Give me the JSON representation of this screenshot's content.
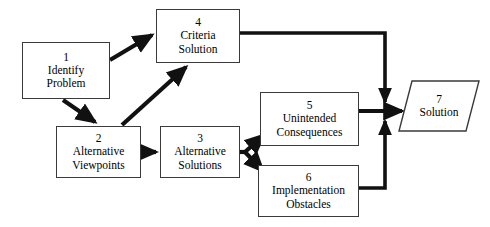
{
  "diagram": {
    "type": "flowchart",
    "background_color": "#ffffff",
    "line_color": "#111111",
    "box_border_color": "#3a3a3a",
    "text_color": "#000000",
    "nodes": [
      {
        "id": "1",
        "number": "1",
        "label_line1": "Identify",
        "label_line2": "Problem",
        "shape": "rectangle",
        "x": 22,
        "y": 42,
        "w": 88,
        "h": 57
      },
      {
        "id": "2",
        "number": "2",
        "label_line1": "Alternative",
        "label_line2": "Viewpoints",
        "shape": "rectangle",
        "x": 56,
        "y": 126,
        "w": 85,
        "h": 52
      },
      {
        "id": "3",
        "number": "3",
        "label_line1": "Alternative",
        "label_line2": "Solutions",
        "shape": "rectangle",
        "x": 160,
        "y": 126,
        "w": 80,
        "h": 52
      },
      {
        "id": "4",
        "number": "4",
        "label_line1": "Criteria",
        "label_line2": "Solution",
        "shape": "rectangle",
        "x": 156,
        "y": 9,
        "w": 84,
        "h": 54
      },
      {
        "id": "5",
        "number": "5",
        "label_line1": "Unintended",
        "label_line2": "Consequences",
        "shape": "rectangle",
        "x": 260,
        "y": 92,
        "w": 99,
        "h": 54
      },
      {
        "id": "6",
        "number": "6",
        "label_line1": "Implementation",
        "label_line2": "Obstacles",
        "shape": "rectangle",
        "x": 258,
        "y": 165,
        "w": 101,
        "h": 52
      },
      {
        "id": "7",
        "number": "7",
        "label_line1": "Solution",
        "label_line2": "",
        "shape": "parallelogram",
        "x": 398,
        "y": 80,
        "w": 82,
        "h": 52
      }
    ],
    "edges": [
      {
        "id": "e1-4",
        "from": "1",
        "to": "4",
        "style": "thick-diagonal",
        "arrow": true
      },
      {
        "id": "e1-2",
        "from": "1",
        "to": "2",
        "style": "thick-diagonal",
        "arrow": true
      },
      {
        "id": "e2-4",
        "from": "2",
        "to": "4",
        "style": "thick-diagonal",
        "arrow": true
      },
      {
        "id": "e2-3",
        "from": "2",
        "to": "3",
        "style": "thick-horizontal",
        "arrow": true
      },
      {
        "id": "e3-5",
        "from": "3",
        "to": "5",
        "style": "thick-diagonal",
        "arrow": true
      },
      {
        "id": "e3-6",
        "from": "3",
        "to": "6",
        "style": "thick-diagonal",
        "arrow": true
      },
      {
        "id": "e4-7",
        "from": "4",
        "to": "7",
        "style": "orthogonal",
        "arrow": true
      },
      {
        "id": "e5-7",
        "from": "5",
        "to": "7",
        "style": "thick-horizontal",
        "arrow": true
      },
      {
        "id": "e6-7",
        "from": "6",
        "to": "7",
        "style": "orthogonal",
        "arrow": true
      }
    ]
  }
}
